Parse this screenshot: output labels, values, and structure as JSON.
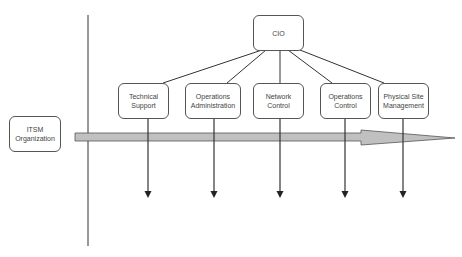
{
  "diagram": {
    "root": {
      "label": "CIO"
    },
    "side_label": {
      "label": "ITSM\nOrganization"
    },
    "departments": [
      {
        "label": "Technical\nSupport"
      },
      {
        "label": "Operations\nAdministration"
      },
      {
        "label": "Network\nControl"
      },
      {
        "label": "Operations\nControl"
      },
      {
        "label": "Physical Site\nManagement"
      }
    ],
    "colors": {
      "line": "#333333",
      "box_border": "#555555",
      "arrow_fill": "#c0c0c0",
      "arrow_stroke": "#555555"
    }
  }
}
